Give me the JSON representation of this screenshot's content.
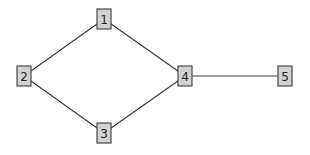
{
  "diagram": {
    "type": "undirected-graph",
    "node_style": {
      "fill": "#d2d2d2",
      "stroke": "#4a4a4a",
      "width": 14,
      "height": 20
    },
    "edge_color": "#3a3a3a",
    "nodes": [
      {
        "id": "1",
        "label": "1",
        "cx": 104,
        "cy": 19
      },
      {
        "id": "2",
        "label": "2",
        "cx": 24,
        "cy": 76
      },
      {
        "id": "3",
        "label": "3",
        "cx": 104,
        "cy": 133
      },
      {
        "id": "4",
        "label": "4",
        "cx": 185,
        "cy": 76
      },
      {
        "id": "5",
        "label": "5",
        "cx": 285,
        "cy": 76
      }
    ],
    "edges": [
      {
        "from": "1",
        "to": "2"
      },
      {
        "from": "1",
        "to": "4"
      },
      {
        "from": "2",
        "to": "3"
      },
      {
        "from": "3",
        "to": "4"
      },
      {
        "from": "4",
        "to": "5"
      }
    ]
  }
}
